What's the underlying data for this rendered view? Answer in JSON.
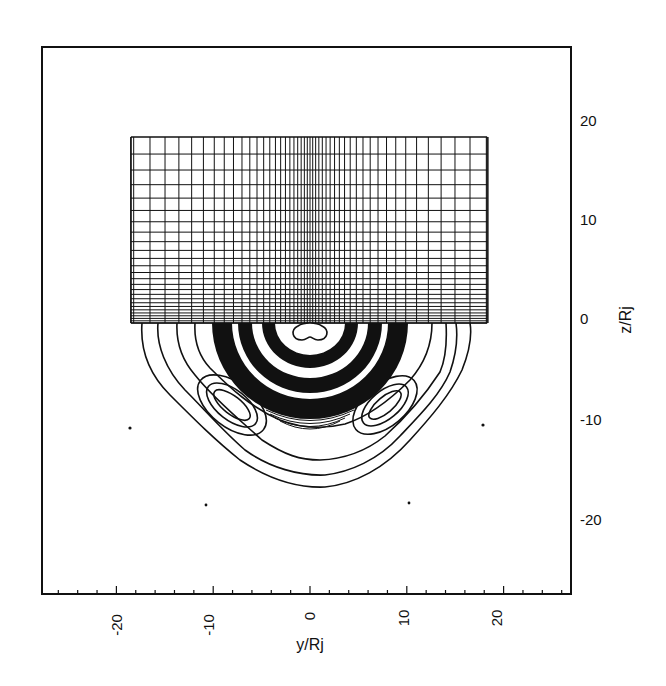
{
  "chart_data": {
    "type": "contour",
    "title": "",
    "xlabel": "y/Rj",
    "ylabel": "z/Rj",
    "ylabel_position": "right",
    "xlim": [
      -28,
      27.5
    ],
    "ylim": [
      -27.5,
      27.5
    ],
    "x_major_ticks": [
      -20,
      -10,
      0,
      10,
      20
    ],
    "x_tick_labels": [
      "-20",
      "-10",
      "0",
      "10",
      "20"
    ],
    "x_minor_tick_step": 2,
    "y_major_ticks": [
      20,
      10,
      0,
      -10,
      -20
    ],
    "y_tick_labels": [
      "20",
      "10",
      "0",
      "-10",
      "-20"
    ],
    "grid": false,
    "legend": null,
    "panels": {
      "upper": {
        "kind": "computational-mesh",
        "description": "Non-uniform stretched rectangular mesh, denser near y=0 and near z=0",
        "y_range": [
          -18.5,
          18.3
        ],
        "z_range": [
          -0.4,
          18.2
        ]
      },
      "lower": {
        "kind": "contour-lines",
        "description": "Nested, roughly concentric semicircular contours centered near (0,0); dense black banding between radii ~2 and ~8 Rj, with lobed side maxima near y=±9, z=-8",
        "outermost_extent": {
          "y": [
            -17,
            16.5
          ],
          "z_min": -17
        },
        "side_lobes": [
          {
            "y": -9,
            "z": -8.5
          },
          {
            "y": 8,
            "z": -8.5
          }
        ],
        "central_feature": {
          "y": 0,
          "z": -1
        }
      }
    },
    "markers": [
      {
        "y": -18.5,
        "z": -11
      },
      {
        "y": 18,
        "z": -10.6
      },
      {
        "y": -10.7,
        "z": -18.6
      },
      {
        "y": 10.3,
        "z": -18.4
      }
    ]
  }
}
